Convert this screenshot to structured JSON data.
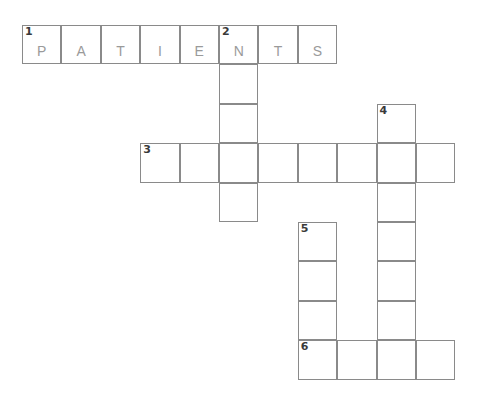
{
  "puzzle": {
    "type": "crossword-grid",
    "title": "",
    "grid": {
      "origin_x": 22,
      "origin_y": 25,
      "cell_size": 39.4,
      "line_color": "#8a8a8a",
      "background": "#ffffff",
      "number_color": "#3a3a3a",
      "letter_color": "#9a9a9a"
    },
    "entries": [
      {
        "number": "1",
        "direction": "across",
        "answer": "PATIENTS",
        "length": 8,
        "row": 0,
        "col": 0,
        "letters": [
          "P",
          "A",
          "T",
          "I",
          "E",
          "N",
          "T",
          "S"
        ]
      },
      {
        "number": "2",
        "direction": "down",
        "answer": "",
        "length": 5,
        "row": 0,
        "col": 5,
        "letters": [
          "N",
          "",
          "",
          "",
          ""
        ]
      },
      {
        "number": "3",
        "direction": "across",
        "answer": "",
        "length": 8,
        "row": 3,
        "col": 3,
        "letters": [
          "",
          "",
          "",
          "",
          "",
          "",
          "",
          ""
        ]
      },
      {
        "number": "4",
        "direction": "down",
        "answer": "",
        "length": 7,
        "row": 2,
        "col": 9,
        "letters": [
          "",
          "",
          "",
          "",
          "",
          "",
          ""
        ]
      },
      {
        "number": "5",
        "direction": "down",
        "answer": "",
        "length": 4,
        "row": 5,
        "col": 7,
        "letters": [
          "",
          "",
          "",
          ""
        ]
      },
      {
        "number": "6",
        "direction": "across",
        "answer": "",
        "length": 4,
        "row": 8,
        "col": 7,
        "letters": [
          "",
          "",
          "",
          ""
        ]
      }
    ],
    "cells": [
      {
        "row": 0,
        "col": 0,
        "number": "1",
        "letter": "P"
      },
      {
        "row": 0,
        "col": 1,
        "number": "",
        "letter": "A"
      },
      {
        "row": 0,
        "col": 2,
        "number": "",
        "letter": "T"
      },
      {
        "row": 0,
        "col": 3,
        "number": "",
        "letter": "I"
      },
      {
        "row": 0,
        "col": 4,
        "number": "",
        "letter": "E"
      },
      {
        "row": 0,
        "col": 5,
        "number": "2",
        "letter": "N"
      },
      {
        "row": 0,
        "col": 6,
        "number": "",
        "letter": "T"
      },
      {
        "row": 0,
        "col": 7,
        "number": "",
        "letter": "S"
      },
      {
        "row": 1,
        "col": 5,
        "number": "",
        "letter": ""
      },
      {
        "row": 2,
        "col": 5,
        "number": "",
        "letter": ""
      },
      {
        "row": 2,
        "col": 9,
        "number": "4",
        "letter": ""
      },
      {
        "row": 3,
        "col": 3,
        "number": "3",
        "letter": ""
      },
      {
        "row": 3,
        "col": 4,
        "number": "",
        "letter": ""
      },
      {
        "row": 3,
        "col": 5,
        "number": "",
        "letter": ""
      },
      {
        "row": 3,
        "col": 6,
        "number": "",
        "letter": ""
      },
      {
        "row": 3,
        "col": 7,
        "number": "",
        "letter": ""
      },
      {
        "row": 3,
        "col": 8,
        "number": "",
        "letter": ""
      },
      {
        "row": 3,
        "col": 9,
        "number": "",
        "letter": ""
      },
      {
        "row": 3,
        "col": 10,
        "number": "",
        "letter": ""
      },
      {
        "row": 4,
        "col": 5,
        "number": "",
        "letter": ""
      },
      {
        "row": 4,
        "col": 9,
        "number": "",
        "letter": ""
      },
      {
        "row": 5,
        "col": 7,
        "number": "5",
        "letter": ""
      },
      {
        "row": 5,
        "col": 9,
        "number": "",
        "letter": ""
      },
      {
        "row": 6,
        "col": 7,
        "number": "",
        "letter": ""
      },
      {
        "row": 6,
        "col": 9,
        "number": "",
        "letter": ""
      },
      {
        "row": 7,
        "col": 7,
        "number": "",
        "letter": ""
      },
      {
        "row": 7,
        "col": 9,
        "number": "",
        "letter": ""
      },
      {
        "row": 8,
        "col": 7,
        "number": "6",
        "letter": ""
      },
      {
        "row": 8,
        "col": 8,
        "number": "",
        "letter": ""
      },
      {
        "row": 8,
        "col": 9,
        "number": "",
        "letter": ""
      },
      {
        "row": 8,
        "col": 10,
        "number": "",
        "letter": ""
      }
    ]
  }
}
